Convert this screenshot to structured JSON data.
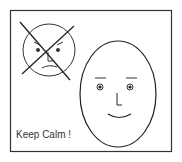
{
  "caption": "Keep Calm !",
  "colors": {
    "stroke": "#222222",
    "frame": "#333333",
    "background": "#ffffff",
    "text": "#333333"
  },
  "figures": {
    "angry_face": {
      "description": "small angry face crossed out with an X"
    },
    "calm_face": {
      "description": "large oval smiling face"
    }
  }
}
